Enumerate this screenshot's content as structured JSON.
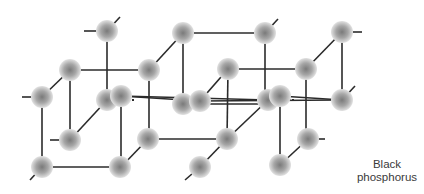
{
  "title": "Black phosphorus",
  "label": {
    "line1": "Black",
    "line2": "phosphorus"
  },
  "colors": {
    "bond": "#2b2b2b",
    "atom_center": "#7a7a7a",
    "atom_edge": "#d8d8d8",
    "background": "#ffffff",
    "text": "#3a3a3a"
  },
  "atoms": [
    [
      107,
      31
    ],
    [
      183,
      33
    ],
    [
      265,
      33
    ],
    [
      342,
      32
    ],
    [
      70,
      70
    ],
    [
      149,
      70
    ],
    [
      228,
      69
    ],
    [
      306,
      69
    ],
    [
      42,
      97
    ],
    [
      107,
      100
    ],
    [
      121,
      96
    ],
    [
      183,
      104
    ],
    [
      200,
      101
    ],
    [
      268,
      100
    ],
    [
      280,
      96
    ],
    [
      342,
      100
    ],
    [
      70,
      140
    ],
    [
      148,
      139
    ],
    [
      227,
      139
    ],
    [
      308,
      139
    ],
    [
      42,
      167
    ],
    [
      120,
      167
    ],
    [
      200,
      167
    ],
    [
      280,
      165
    ]
  ],
  "bonds": [
    [
      84,
      31,
      107,
      31
    ],
    [
      107,
      31,
      120,
      17
    ],
    [
      107,
      31,
      107,
      100
    ],
    [
      183,
      33,
      265,
      33
    ],
    [
      183,
      33,
      149,
      70
    ],
    [
      183,
      33,
      183,
      104
    ],
    [
      265,
      33,
      278,
      19
    ],
    [
      265,
      33,
      265,
      100
    ],
    [
      342,
      32,
      362,
      32
    ],
    [
      342,
      32,
      306,
      69
    ],
    [
      342,
      32,
      342,
      100
    ],
    [
      70,
      70,
      149,
      70
    ],
    [
      70,
      70,
      42,
      97
    ],
    [
      70,
      70,
      70,
      140
    ],
    [
      149,
      70,
      149,
      139
    ],
    [
      228,
      69,
      306,
      69
    ],
    [
      228,
      69,
      200,
      101
    ],
    [
      228,
      69,
      227,
      139
    ],
    [
      306,
      69,
      306,
      139
    ],
    [
      22,
      97,
      42,
      97
    ],
    [
      42,
      97,
      42,
      167
    ],
    [
      121,
      96,
      121,
      167
    ],
    [
      121,
      96,
      200,
      101
    ],
    [
      121,
      96,
      268,
      100
    ],
    [
      183,
      104,
      268,
      104
    ],
    [
      280,
      96,
      342,
      100
    ],
    [
      280,
      96,
      280,
      165
    ],
    [
      200,
      101,
      342,
      100
    ],
    [
      342,
      100,
      355,
      86
    ],
    [
      50,
      140,
      70,
      140
    ],
    [
      70,
      140,
      107,
      100
    ],
    [
      148,
      139,
      227,
      139
    ],
    [
      148,
      139,
      121,
      167
    ],
    [
      227,
      139,
      268,
      100
    ],
    [
      227,
      139,
      200,
      167
    ],
    [
      308,
      139,
      325,
      139
    ],
    [
      308,
      139,
      280,
      165
    ],
    [
      42,
      167,
      120,
      167
    ],
    [
      42,
      167,
      30,
      180
    ],
    [
      200,
      167,
      185,
      180
    ]
  ],
  "dotted_bonds": [
    [
      112,
      100,
      134,
      100
    ],
    [
      272,
      100,
      294,
      100
    ]
  ]
}
